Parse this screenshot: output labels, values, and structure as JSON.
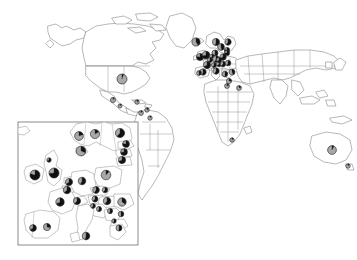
{
  "figure": {
    "type": "map-with-pie-charts",
    "width": 357,
    "height": 260,
    "background_color": "#ffffff",
    "outline_color": "#7d7d7d"
  },
  "legend": {
    "slice_colors": {
      "dark": "#111111",
      "light": "#a8a8a8",
      "outline": "#2b2b2b"
    },
    "slice_names": [
      "dark",
      "light"
    ]
  },
  "inset": {
    "name": "europe-inset",
    "frame": {
      "x": 18,
      "y": 122,
      "width": 120,
      "height": 123
    },
    "frame_color": "#6e6e6e"
  },
  "chart_data": {
    "type": "pie",
    "title": "",
    "subtitle": "",
    "xlabel": "",
    "ylabel": "",
    "legend_position": "none",
    "grid": false,
    "series": [
      {
        "name": "dark",
        "color": "#111111"
      },
      {
        "name": "light",
        "color": "#a8a8a8"
      }
    ],
    "world_pies": [
      {
        "label": "United States",
        "x": 122,
        "y": 79,
        "r": 5.0,
        "dark": 0.06,
        "light": 0.94
      },
      {
        "label": "Mexico",
        "x": 113,
        "y": 100,
        "r": 2.6,
        "dark": 0.1,
        "light": 0.9
      },
      {
        "label": "Guatemala",
        "x": 120,
        "y": 106,
        "r": 2.0,
        "dark": 0.12,
        "light": 0.88
      },
      {
        "label": "Caribbean",
        "x": 137,
        "y": 102,
        "r": 2.2,
        "dark": 0.15,
        "light": 0.85
      },
      {
        "label": "Colombia",
        "x": 141,
        "y": 113,
        "r": 2.4,
        "dark": 0.12,
        "light": 0.88
      },
      {
        "label": "Venezuela",
        "x": 147,
        "y": 110,
        "r": 2.2,
        "dark": 0.18,
        "light": 0.82
      },
      {
        "label": "Brazil",
        "x": 150,
        "y": 118,
        "r": 2.2,
        "dark": 0.1,
        "light": 0.9
      },
      {
        "label": "Iceland",
        "x": 196,
        "y": 42,
        "r": 4.1,
        "dark": 0.42,
        "light": 0.58
      },
      {
        "label": "Norway",
        "x": 216,
        "y": 42,
        "r": 3.6,
        "dark": 0.55,
        "light": 0.45
      },
      {
        "label": "Sweden",
        "x": 221,
        "y": 47,
        "r": 3.4,
        "dark": 0.48,
        "light": 0.52
      },
      {
        "label": "Finland",
        "x": 228,
        "y": 42,
        "r": 3.2,
        "dark": 0.6,
        "light": 0.4
      },
      {
        "label": "Denmark",
        "x": 215,
        "y": 53,
        "r": 3.0,
        "dark": 0.52,
        "light": 0.48
      },
      {
        "label": "Ireland",
        "x": 200,
        "y": 57,
        "r": 3.6,
        "dark": 0.78,
        "light": 0.22
      },
      {
        "label": "United Kingdom",
        "x": 206,
        "y": 55,
        "r": 3.8,
        "dark": 0.72,
        "light": 0.28
      },
      {
        "label": "Netherlands",
        "x": 212,
        "y": 57,
        "r": 2.8,
        "dark": 0.66,
        "light": 0.34
      },
      {
        "label": "Belgium",
        "x": 210,
        "y": 60,
        "r": 2.6,
        "dark": 0.62,
        "light": 0.38
      },
      {
        "label": "Germany",
        "x": 216,
        "y": 59,
        "r": 3.4,
        "dark": 0.58,
        "light": 0.42
      },
      {
        "label": "Poland",
        "x": 223,
        "y": 57,
        "r": 3.2,
        "dark": 0.7,
        "light": 0.3
      },
      {
        "label": "Estonia",
        "x": 227,
        "y": 50,
        "r": 2.6,
        "dark": 0.8,
        "light": 0.2
      },
      {
        "label": "Latvia",
        "x": 227,
        "y": 53,
        "r": 2.6,
        "dark": 0.76,
        "light": 0.24
      },
      {
        "label": "France",
        "x": 207,
        "y": 65,
        "r": 3.6,
        "dark": 0.68,
        "light": 0.32
      },
      {
        "label": "Switzerland",
        "x": 214,
        "y": 65,
        "r": 2.6,
        "dark": 0.6,
        "light": 0.4
      },
      {
        "label": "Austria",
        "x": 219,
        "y": 64,
        "r": 2.8,
        "dark": 0.64,
        "light": 0.36
      },
      {
        "label": "Czechia",
        "x": 219,
        "y": 60,
        "r": 2.6,
        "dark": 0.66,
        "light": 0.34
      },
      {
        "label": "Hungary",
        "x": 223,
        "y": 64,
        "r": 2.8,
        "dark": 0.62,
        "light": 0.38
      },
      {
        "label": "Romania",
        "x": 228,
        "y": 63,
        "r": 2.8,
        "dark": 0.58,
        "light": 0.42
      },
      {
        "label": "Spain",
        "x": 203,
        "y": 72,
        "r": 3.2,
        "dark": 0.55,
        "light": 0.45
      },
      {
        "label": "Portugal",
        "x": 199,
        "y": 73,
        "r": 2.4,
        "dark": 0.5,
        "light": 0.5
      },
      {
        "label": "Italy",
        "x": 216,
        "y": 71,
        "r": 3.2,
        "dark": 0.58,
        "light": 0.42
      },
      {
        "label": "Greece",
        "x": 225,
        "y": 74,
        "r": 2.8,
        "dark": 0.52,
        "light": 0.48
      },
      {
        "label": "Turkey",
        "x": 232,
        "y": 72,
        "r": 3.0,
        "dark": 0.45,
        "light": 0.55
      },
      {
        "label": "Israel",
        "x": 229,
        "y": 81,
        "r": 2.6,
        "dark": 0.3,
        "light": 0.7
      },
      {
        "label": "Egypt",
        "x": 227,
        "y": 86,
        "r": 2.4,
        "dark": 0.2,
        "light": 0.8
      },
      {
        "label": "Saudi Arabia",
        "x": 239,
        "y": 88,
        "r": 2.4,
        "dark": 0.22,
        "light": 0.78
      },
      {
        "label": "South Africa",
        "x": 232,
        "y": 140,
        "r": 2.2,
        "dark": 0.15,
        "light": 0.85
      },
      {
        "label": "Australia",
        "x": 332,
        "y": 150,
        "r": 4.4,
        "dark": 0.08,
        "light": 0.92
      },
      {
        "label": "New Zealand",
        "x": 348,
        "y": 166,
        "r": 2.2,
        "dark": 0.12,
        "light": 0.88
      }
    ],
    "inset_pies": [
      {
        "label": "Ireland",
        "x": 35,
        "y": 175,
        "r": 5.0,
        "dark": 0.8,
        "light": 0.2
      },
      {
        "label": "United Kingdom",
        "x": 54,
        "y": 173,
        "r": 5.0,
        "dark": 0.74,
        "light": 0.26
      },
      {
        "label": "Scotland",
        "x": 49,
        "y": 160,
        "r": 2.2,
        "dark": 0.7,
        "light": 0.3
      },
      {
        "label": "Norway",
        "x": 79,
        "y": 136,
        "r": 4.4,
        "dark": 0.2,
        "light": 0.8
      },
      {
        "label": "Sweden",
        "x": 95,
        "y": 134,
        "r": 4.6,
        "dark": 0.18,
        "light": 0.82
      },
      {
        "label": "Finland",
        "x": 120,
        "y": 133,
        "r": 4.6,
        "dark": 0.62,
        "light": 0.38
      },
      {
        "label": "Denmark",
        "x": 81,
        "y": 151,
        "r": 4.8,
        "dark": 0.32,
        "light": 0.68
      },
      {
        "label": "Estonia",
        "x": 126,
        "y": 144,
        "r": 3.4,
        "dark": 0.78,
        "light": 0.22
      },
      {
        "label": "Latvia",
        "x": 124,
        "y": 152,
        "r": 3.4,
        "dark": 0.74,
        "light": 0.26
      },
      {
        "label": "Lithuania",
        "x": 122,
        "y": 160,
        "r": 3.6,
        "dark": 0.7,
        "light": 0.3
      },
      {
        "label": "Netherlands",
        "x": 69,
        "y": 182,
        "r": 3.6,
        "dark": 0.66,
        "light": 0.34
      },
      {
        "label": "Belgium",
        "x": 67,
        "y": 190,
        "r": 3.8,
        "dark": 0.64,
        "light": 0.36
      },
      {
        "label": "Germany",
        "x": 82,
        "y": 181,
        "r": 3.8,
        "dark": 0.58,
        "light": 0.42
      },
      {
        "label": "Poland",
        "x": 106,
        "y": 175,
        "r": 4.8,
        "dark": 0.12,
        "light": 0.88
      },
      {
        "label": "Czechia",
        "x": 96,
        "y": 190,
        "r": 3.4,
        "dark": 0.6,
        "light": 0.4
      },
      {
        "label": "Slovakia",
        "x": 105,
        "y": 190,
        "r": 2.8,
        "dark": 0.62,
        "light": 0.38
      },
      {
        "label": "France",
        "x": 60,
        "y": 202,
        "r": 4.2,
        "dark": 0.68,
        "light": 0.32
      },
      {
        "label": "Switzerland",
        "x": 77,
        "y": 201,
        "r": 3.6,
        "dark": 0.62,
        "light": 0.38
      },
      {
        "label": "Austria",
        "x": 95,
        "y": 199,
        "r": 3.0,
        "dark": 0.64,
        "light": 0.36
      },
      {
        "label": "Hungary",
        "x": 107,
        "y": 201,
        "r": 3.8,
        "dark": 0.6,
        "light": 0.4
      },
      {
        "label": "Romania",
        "x": 122,
        "y": 202,
        "r": 4.2,
        "dark": 0.35,
        "light": 0.65
      },
      {
        "label": "Slovenia",
        "x": 93,
        "y": 206,
        "r": 2.4,
        "dark": 0.6,
        "light": 0.4
      },
      {
        "label": "Croatia",
        "x": 99,
        "y": 209,
        "r": 2.6,
        "dark": 0.58,
        "light": 0.42
      },
      {
        "label": "Serbia",
        "x": 110,
        "y": 211,
        "r": 2.6,
        "dark": 0.55,
        "light": 0.45
      },
      {
        "label": "Bulgaria",
        "x": 121,
        "y": 214,
        "r": 2.8,
        "dark": 0.5,
        "light": 0.5
      },
      {
        "label": "Portugal",
        "x": 33,
        "y": 228,
        "r": 3.4,
        "dark": 0.66,
        "light": 0.34
      },
      {
        "label": "Spain",
        "x": 47,
        "y": 227,
        "r": 3.6,
        "dark": 0.3,
        "light": 0.7
      },
      {
        "label": "Italy",
        "x": 86,
        "y": 236,
        "r": 3.8,
        "dark": 0.55,
        "light": 0.45
      },
      {
        "label": "Greece",
        "x": 119,
        "y": 228,
        "r": 3.0,
        "dark": 0.52,
        "light": 0.48
      },
      {
        "label": "Macedonia",
        "x": 114,
        "y": 221,
        "r": 2.2,
        "dark": 0.55,
        "light": 0.45
      }
    ]
  }
}
